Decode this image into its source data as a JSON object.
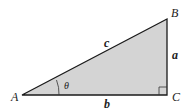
{
  "diagram": {
    "type": "right-triangle",
    "fill_color": "#d4d4d4",
    "stroke_color": "#1a1a1a",
    "vertices": {
      "A": {
        "label": "A",
        "x": 22,
        "y": 95
      },
      "B": {
        "label": "B",
        "x": 167,
        "y": 19
      },
      "C": {
        "label": "C",
        "x": 167,
        "y": 95
      }
    },
    "sides": {
      "hypotenuse": {
        "label": "c"
      },
      "opposite": {
        "label": "a"
      },
      "adjacent": {
        "label": "b"
      }
    },
    "angle": {
      "label": "θ",
      "vertex": "A"
    },
    "right_angle_vertex": "C"
  }
}
